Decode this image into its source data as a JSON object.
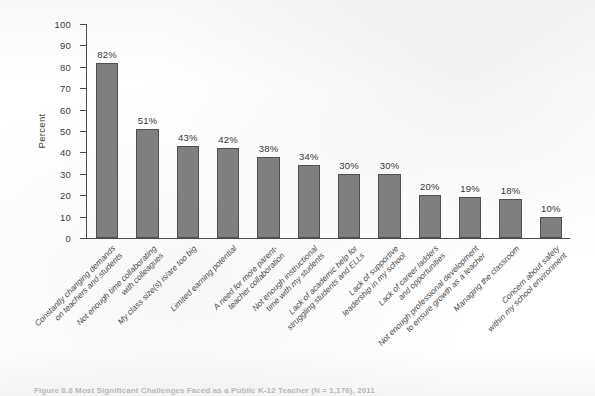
{
  "figure": {
    "caption": "Figure 8.8  Most Significant Challenges Faced as a Public K-12 Teacher (N = 1,176), 2011",
    "bar_color": "#7f7f7f",
    "bar_border_color": "#4f4f4f",
    "axis_color": "#4a4a4a",
    "background": "#ffffff"
  },
  "axes": {
    "ylabel": "Percent",
    "yticks": [
      "0",
      "10",
      "20",
      "30",
      "40",
      "50",
      "60",
      "70",
      "80",
      "90",
      "100"
    ]
  },
  "chart_data": {
    "type": "bar",
    "title": "Figure 8.8  Most Significant Challenges Faced as a Public K-12 Teacher (N = 1,176), 2011",
    "xlabel": "",
    "ylabel": "Percent",
    "ylim": [
      0,
      100
    ],
    "ytick_step": 10,
    "grid": false,
    "legend": "none",
    "orientation": "vertical",
    "value_label_suffix": "%",
    "categories": [
      "Constantly changing demands on teachers and students",
      "Not enough time collaborating with colleagues",
      "My class size(s) is/are too big",
      "Limited earning potential",
      "A need for more parent-teacher collaboration",
      "Not enough instructional time with my students",
      "Lack of academic help for struggling students and ELLs",
      "Lack of supportive leadership in my school",
      "Lack of career ladders and opportunities",
      "Not enough professional development to ensure growth as a teacher",
      "Managing the classroom",
      "Concern about safety within my school environment"
    ],
    "categories_wrapped": [
      [
        "Constantly changing demands",
        "on teachers and students"
      ],
      [
        "Not enough time collaborating",
        "with colleagues"
      ],
      [
        "My class size(s) is/are too big"
      ],
      [
        "Limited earning potential"
      ],
      [
        "A need for more parent-",
        "teacher collaboration"
      ],
      [
        "Not enough instructional",
        "time with my students"
      ],
      [
        "Lack of academic help for",
        "struggling students and ELLs"
      ],
      [
        "Lack of supportive",
        "leadership in my school"
      ],
      [
        "Lack of career ladders",
        "and opportunities"
      ],
      [
        "Not enough professional development",
        "to ensure growth as a teacher"
      ],
      [
        "Managing the classroom"
      ],
      [
        "Concern about safety",
        "within my school environment"
      ]
    ],
    "values": [
      82,
      51,
      43,
      42,
      38,
      34,
      30,
      30,
      20,
      19,
      18,
      10
    ],
    "value_labels": [
      "82%",
      "51%",
      "43%",
      "42%",
      "38%",
      "34%",
      "30%",
      "30%",
      "20%",
      "19%",
      "18%",
      "10%"
    ]
  }
}
